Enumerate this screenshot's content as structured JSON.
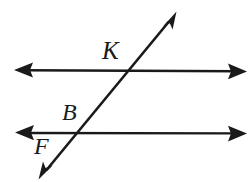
{
  "figure": {
    "kind": "geometry-diagram",
    "background_color": "#ffffff",
    "stroke_color": "#1a1a1a",
    "labels": [
      {
        "id": "K",
        "text": "K",
        "role": "intersection-point-upper"
      },
      {
        "id": "B",
        "text": "B",
        "role": "intersection-point-lower"
      },
      {
        "id": "F",
        "text": "F",
        "role": "point-on-transversal-below"
      }
    ],
    "lines": [
      {
        "id": "upper-parallel",
        "name": "upper horizontal line",
        "orientation": "horizontal",
        "arrowheads": "both",
        "x1": 16,
        "y1": 70,
        "x2": 245,
        "y2": 71
      },
      {
        "id": "lower-parallel",
        "name": "lower horizontal line",
        "orientation": "horizontal",
        "arrowheads": "both",
        "x1": 17,
        "y1": 133,
        "x2": 245,
        "y2": 133
      },
      {
        "id": "transversal",
        "name": "transversal line",
        "orientation": "diagonal",
        "arrowheads": "both",
        "x1": 40,
        "y1": 178,
        "x2": 176,
        "y2": 12
      }
    ],
    "intersections": [
      {
        "label": "K",
        "x": 130,
        "y": 71,
        "lines": [
          "upper-parallel",
          "transversal"
        ]
      },
      {
        "label": "B",
        "x": 78,
        "y": 133,
        "lines": [
          "lower-parallel",
          "transversal"
        ]
      }
    ]
  }
}
